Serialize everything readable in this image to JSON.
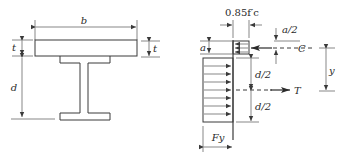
{
  "figure": {
    "left_panel": {
      "title": "Composite section (concrete slab on steel I-beam)",
      "labels": {
        "slab_width": "b",
        "slab_thickness_left": "t",
        "slab_thickness_right": "t",
        "beam_depth": "d"
      }
    },
    "right_panel": {
      "title": "Plastic stress distribution",
      "labels": {
        "concrete_stress": "0.85f′c",
        "compression_depth": "a",
        "half_compression_depth": "a/2",
        "compression_force": "C",
        "half_depth_top": "d/2",
        "half_depth_bottom": "d/2",
        "tension_force": "T",
        "lever_arm": "y",
        "steel_yield_stress": "Fy"
      }
    },
    "colors": {
      "line": "#3a3a3a",
      "text": "#2a2a2a",
      "background": "#ffffff"
    }
  }
}
